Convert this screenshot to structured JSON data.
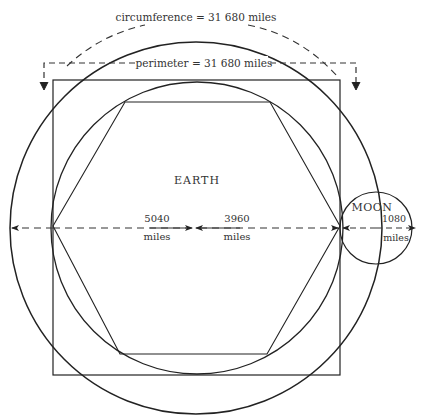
{
  "labels": {
    "circumference": "circumference = 31 680  miles",
    "perimeter": "perimeter = 31 680  miles",
    "earth": "EARTH",
    "moon": "MOON",
    "dist_outer_value": "5040",
    "dist_outer_unit": "miles",
    "dist_earth_value": "3960",
    "dist_earth_unit": "miles",
    "dist_moon_value": "1080",
    "dist_moon_unit": "miles"
  },
  "colors": {
    "stroke": "#222222",
    "text": "#333333",
    "background": "#ffffff"
  }
}
